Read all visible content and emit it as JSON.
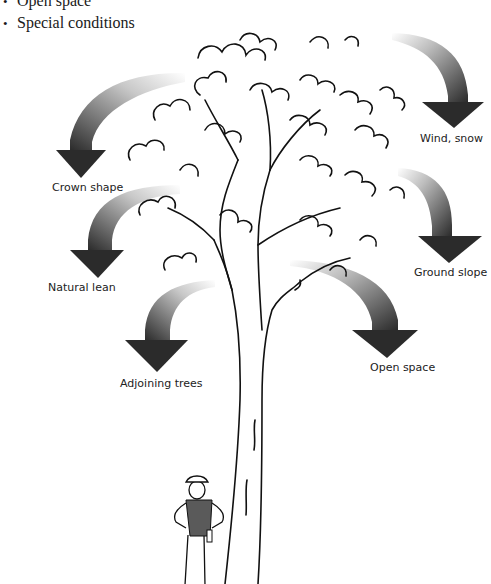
{
  "bullet_list": {
    "items": [
      {
        "bullet": "•",
        "text": "Open space"
      },
      {
        "bullet": "•",
        "text": "Special conditions"
      }
    ]
  },
  "diagram": {
    "factors": [
      {
        "id": "crown-shape",
        "label": "Crown shape"
      },
      {
        "id": "wind-snow",
        "label": "Wind, snow"
      },
      {
        "id": "natural-lean",
        "label": "Natural lean"
      },
      {
        "id": "ground-slope",
        "label": "Ground slope"
      },
      {
        "id": "adjoining-trees",
        "label": "Adjoining trees"
      },
      {
        "id": "open-space",
        "label": "Open space"
      }
    ],
    "colors": {
      "arrow_dark": "#2b2b2b",
      "arrow_light": "#ffffff",
      "ink": "#111111",
      "vest": "#5a5a5a"
    }
  }
}
